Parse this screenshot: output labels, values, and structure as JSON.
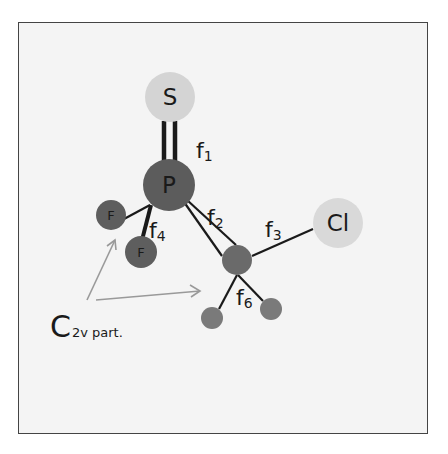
{
  "diagram": {
    "background_color": "#f4f4f4",
    "frame_color": "#444444",
    "atoms": [
      {
        "id": "S",
        "label": "S",
        "cx": 170,
        "cy": 97,
        "r": 25,
        "fill": "#d4d4d4"
      },
      {
        "id": "P",
        "label": "P",
        "cx": 169,
        "cy": 185,
        "r": 26,
        "fill": "#5c5c5c"
      },
      {
        "id": "F1",
        "label": "F",
        "cx": 111,
        "cy": 215,
        "r": 15,
        "fill": "#5e5e5e"
      },
      {
        "id": "F2",
        "label": "F",
        "cx": 141,
        "cy": 252,
        "r": 16,
        "fill": "#5e5e5e"
      },
      {
        "id": "C",
        "label": "",
        "cx": 237,
        "cy": 260,
        "r": 15,
        "fill": "#6a6a6a"
      },
      {
        "id": "Cl",
        "label": "Cl",
        "cx": 338,
        "cy": 223,
        "r": 25,
        "fill": "#d9d9d9"
      },
      {
        "id": "H1",
        "label": "",
        "cx": 212,
        "cy": 318,
        "r": 11,
        "fill": "#7a7a7a"
      },
      {
        "id": "H2",
        "label": "",
        "cx": 271,
        "cy": 309,
        "r": 11,
        "fill": "#7a7a7a"
      }
    ],
    "bond_labels": [
      {
        "id": "f1",
        "main": "f",
        "sub": "1",
        "x": 196,
        "y": 158
      },
      {
        "id": "f2",
        "main": "f",
        "sub": "2",
        "x": 207,
        "y": 225
      },
      {
        "id": "f3",
        "main": "f",
        "sub": "3",
        "x": 265,
        "y": 237
      },
      {
        "id": "f4",
        "main": "f",
        "sub": "4",
        "x": 149,
        "y": 238
      },
      {
        "id": "f6",
        "main": "f",
        "sub": "6",
        "x": 236,
        "y": 305
      }
    ],
    "annotation": {
      "main": "C",
      "sub": "2v part."
    }
  }
}
